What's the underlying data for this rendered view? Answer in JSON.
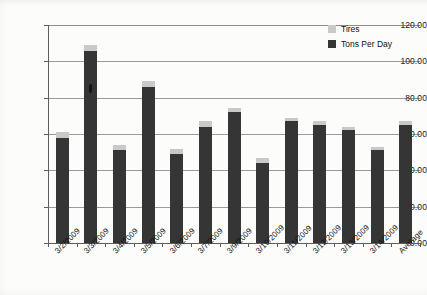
{
  "chart_data": {
    "type": "bar",
    "title": "",
    "subtitle": "",
    "xlabel": "",
    "ylabel": "",
    "stacked": true,
    "grid": true,
    "legend_position": "top-right",
    "ylim": [
      0,
      120
    ],
    "ytick_step": 20,
    "ytick_labels": [
      "0.00",
      "20.00",
      "40.00",
      "60.00",
      "80.00",
      "100.00",
      "120.00"
    ],
    "ytick_values": [
      0,
      20,
      40,
      60,
      80,
      100,
      120
    ],
    "categories": [
      "3/2/2009",
      "3/3/2009",
      "3/4/2009",
      "3/5/2009",
      "3/6/2009",
      "3/7/2009",
      "3/9/2009",
      "3/10/2009",
      "3/11/2009",
      "3/12/2009",
      "3/13/2009",
      "3/14/2009",
      "Average"
    ],
    "series": [
      {
        "name": "Tons Per Day",
        "color": "#353535",
        "values": [
          58.0,
          105.5,
          51.0,
          86.0,
          49.0,
          64.0,
          72.0,
          44.0,
          67.0,
          65.0,
          62.0,
          51.0,
          65.0
        ]
      },
      {
        "name": "Tires",
        "color": "#c9c9c9",
        "values": [
          3.0,
          3.5,
          3.0,
          3.0,
          3.0,
          3.0,
          2.5,
          3.0,
          2.0,
          2.0,
          2.0,
          2.0,
          2.0
        ]
      }
    ],
    "totals": [
      61.0,
      109.0,
      54.0,
      89.0,
      52.0,
      67.0,
      74.5,
      47.0,
      69.0,
      67.0,
      64.0,
      53.0,
      67.0
    ]
  },
  "legend": {
    "items": [
      {
        "label": "Tires",
        "color": "#c9c9c9",
        "swatch": "tires"
      },
      {
        "label": "Tons Per Day",
        "color": "#353535",
        "swatch": "tons"
      }
    ]
  }
}
